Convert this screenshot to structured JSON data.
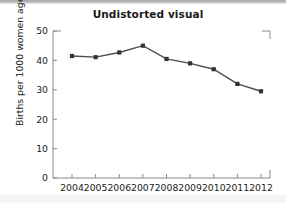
{
  "chart_data": {
    "type": "line",
    "title": "Undistorted visual",
    "xlabel": "",
    "ylabel": "Births per 1000 women ages 15-19",
    "categories": [
      "2004",
      "2005",
      "2006",
      "2007",
      "2008",
      "2009",
      "2010",
      "2011",
      "2012"
    ],
    "values": [
      41.5,
      41.1,
      42.7,
      45.0,
      40.5,
      39.0,
      37.0,
      32.0,
      29.5
    ],
    "series": [
      {
        "name": "Births per 1000 women ages 15-19",
        "values": [
          41.5,
          41.1,
          42.7,
          45.0,
          40.5,
          39.0,
          37.0,
          32.0,
          29.5
        ]
      }
    ],
    "ylim": [
      0,
      50
    ],
    "yticks": [
      "0",
      "10",
      "20",
      "30",
      "40",
      "50"
    ],
    "ytick_values": [
      0,
      10,
      20,
      30,
      40,
      50
    ],
    "grid": false,
    "legend_position": "none",
    "marker": "square",
    "line_color": "#4d4d4d",
    "marker_color": "#333333",
    "axis_color": "#808080"
  },
  "figure": {
    "background_color": "#ffffff",
    "top_band_color": "#b0b0b0",
    "bottom_band_color": "#f4f4f4"
  }
}
